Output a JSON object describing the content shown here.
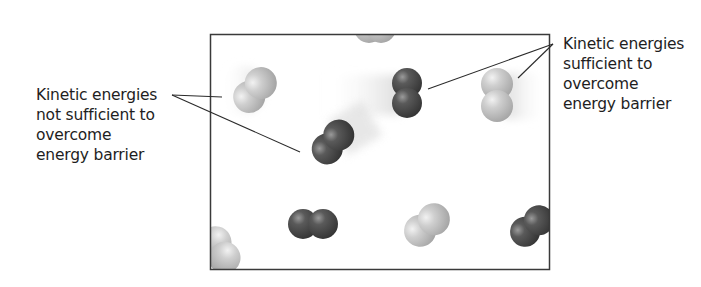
{
  "diagram": {
    "type": "molecular-collision-kinetic-energy",
    "frame": {
      "x": 210,
      "y": 34,
      "width": 339,
      "height": 236,
      "stroke": "#3a3a3a"
    },
    "labels": {
      "left": {
        "lines": [
          "Kinetic energies",
          "not sufficient to",
          "overcome",
          "energy barrier"
        ]
      },
      "right": {
        "lines": [
          "Kinetic energies",
          "sufficient to",
          "overcome",
          "energy barrier"
        ]
      }
    },
    "colors": {
      "light_molecule": "#bdbdbd",
      "dark_molecule": "#4a4a4a",
      "leader_line": "#2a2a2a",
      "text": "#1e1e1e"
    },
    "molecules": [
      {
        "id": "m1",
        "shade": "light",
        "cx": 255,
        "cy": 90,
        "angle": 40,
        "motion_blur": "left",
        "energy": "insufficient"
      },
      {
        "id": "m2",
        "shade": "light",
        "cx": 375,
        "cy": 30,
        "angle": 0,
        "motion_blur": "none"
      },
      {
        "id": "m3",
        "shade": "dark",
        "cx": 333,
        "cy": 142,
        "angle": 40,
        "motion_blur": "up-right",
        "energy": "insufficient"
      },
      {
        "id": "m4",
        "shade": "dark",
        "cx": 407,
        "cy": 93,
        "angle": 90,
        "motion_blur": "left",
        "energy": "sufficient"
      },
      {
        "id": "m5",
        "shade": "light",
        "cx": 497,
        "cy": 95,
        "angle": 90,
        "motion_blur": "right",
        "energy": "sufficient"
      },
      {
        "id": "m6",
        "shade": "light",
        "cx": 218,
        "cy": 250,
        "angle": 60,
        "motion_blur": "none"
      },
      {
        "id": "m7",
        "shade": "dark",
        "cx": 313,
        "cy": 224,
        "angle": 0,
        "motion_blur": "none"
      },
      {
        "id": "m8",
        "shade": "light",
        "cx": 427,
        "cy": 225,
        "angle": -35,
        "motion_blur": "none"
      },
      {
        "id": "m9",
        "shade": "dark",
        "cx": 532,
        "cy": 226,
        "angle": -40,
        "motion_blur": "none"
      }
    ]
  }
}
